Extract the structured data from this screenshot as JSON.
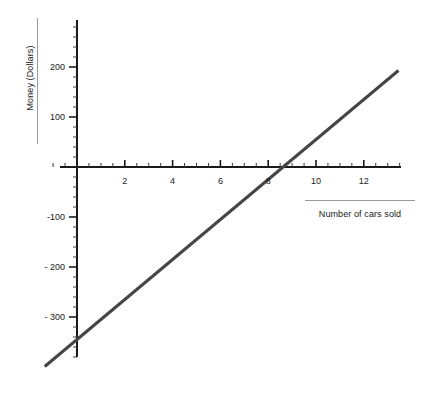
{
  "chart_data": {
    "type": "line",
    "title": "",
    "xlabel": "Number of cars sold",
    "ylabel": "Money (Dollars)",
    "xlim": [
      -1.35,
      13.5
    ],
    "ylim": [
      -415,
      295
    ],
    "grid": false,
    "legend": null,
    "x_ticks_major": [
      2,
      4,
      6,
      8,
      10,
      12
    ],
    "x_tick_labels": [
      "2",
      "4",
      "6",
      "8",
      "10",
      "12"
    ],
    "x_tick_minor_step": 0.5,
    "y_ticks_major": [
      200,
      100,
      -100,
      -200,
      -300
    ],
    "y_tick_labels": [
      "200",
      "100",
      "-100",
      "- 200",
      "- 300"
    ],
    "y_tick_minor_step": 20,
    "series": [
      {
        "name": "Money",
        "color": "#454545",
        "line_width": 3,
        "slope": 40,
        "intercept": -345,
        "x_intercept": 8.6,
        "x": [
          -1.35,
          13.45
        ],
        "values": [
          -399,
          193
        ],
        "points": [
          {
            "x": -1.35,
            "y": -399
          },
          {
            "x": 0,
            "y": -345
          },
          {
            "x": 4,
            "y": -185
          },
          {
            "x": 8.6,
            "y": 0
          },
          {
            "x": 13.45,
            "y": 193
          }
        ]
      }
    ],
    "axis_color": "#1a1a1a",
    "tick_color": "#3a3a3a",
    "rule_color": "#9a9a9a",
    "background": "#ffffff"
  },
  "axes": {
    "origin_px": {
      "x": 77,
      "y": 167
    },
    "x_scale_px_per_unit": 23.9,
    "y_scale_px_per_unit": 0.5
  }
}
